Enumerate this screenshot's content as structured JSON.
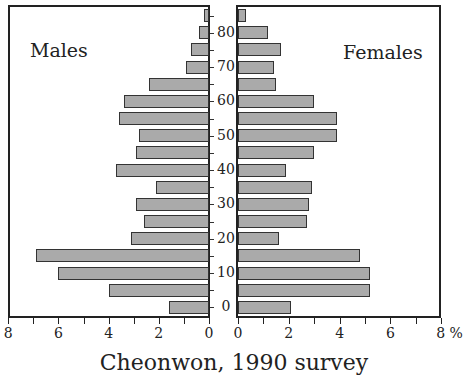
{
  "chart_data": {
    "type": "bar",
    "subtype": "population-pyramid",
    "title": "Cheonwon, 1990 survey",
    "xlabel": "%",
    "ylabel": "Age",
    "categories": [
      "0-4",
      "5-9",
      "10-14",
      "15-19",
      "20-24",
      "25-29",
      "30-34",
      "35-39",
      "40-44",
      "45-49",
      "50-54",
      "55-59",
      "60-64",
      "65-69",
      "70-74",
      "75-79",
      "80-84",
      "85+"
    ],
    "series": [
      {
        "name": "Males",
        "values": [
          1.6,
          4.0,
          6.0,
          6.9,
          3.1,
          2.6,
          2.9,
          2.1,
          3.7,
          2.9,
          2.8,
          3.6,
          3.4,
          2.4,
          0.9,
          0.7,
          0.4,
          0.2
        ]
      },
      {
        "name": "Females",
        "values": [
          2.1,
          5.2,
          5.2,
          4.8,
          1.6,
          2.7,
          2.8,
          2.9,
          1.9,
          3.0,
          3.9,
          3.9,
          3.0,
          1.5,
          1.4,
          1.7,
          1.2,
          0.3
        ]
      }
    ],
    "xlim": [
      0,
      8
    ],
    "x_ticks": [
      0,
      2,
      4,
      6,
      8
    ],
    "age_tick_labels": [
      "0",
      "10",
      "20",
      "30",
      "40",
      "50",
      "60",
      "70",
      "80"
    ],
    "legend": "none (panel labels Males / Females)",
    "grid": false
  },
  "panels": {
    "left_title": "Males",
    "right_title": "Females"
  },
  "axis": {
    "left_ticks": [
      "8",
      "6",
      "4",
      "2",
      "0"
    ],
    "right_ticks": [
      "0",
      "2",
      "4",
      "6",
      "8 %"
    ],
    "age_labels": [
      "0",
      "10",
      "20",
      "30",
      "40",
      "50",
      "60",
      "70",
      "80"
    ]
  },
  "caption": "Cheonwon, 1990 survey"
}
